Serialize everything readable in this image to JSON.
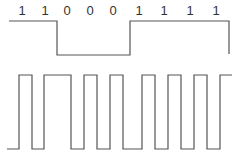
{
  "bits": {
    "labels": [
      "1",
      "1",
      "0",
      "0",
      "0",
      "1",
      "1",
      "1",
      "1"
    ],
    "x": [
      22,
      45,
      67,
      90,
      113,
      139,
      164,
      190,
      216
    ]
  },
  "data_signal": {
    "description": "NRZ-L data waveform",
    "high_y": 21,
    "low_y": 55,
    "points": [
      [
        9,
        21
      ],
      [
        57,
        21
      ],
      [
        57,
        55
      ],
      [
        130,
        55
      ],
      [
        130,
        21
      ],
      [
        229,
        21
      ],
      [
        229,
        54
      ]
    ]
  },
  "encoded_signal": {
    "description": "Encoded pulse waveform",
    "high_y": 75,
    "low_y": 149,
    "transitions_x": [
      19,
      32,
      44,
      71,
      84,
      97,
      110,
      123,
      142,
      155,
      168,
      181,
      194,
      207,
      220
    ],
    "start_x": 7,
    "end_x": 232
  },
  "colors": {
    "line": "#555555",
    "text": "#333333"
  }
}
